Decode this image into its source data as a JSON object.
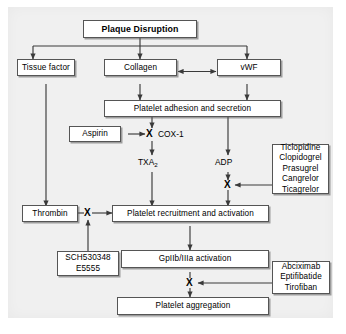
{
  "figure": {
    "background_color": "#f0f0f0",
    "line_color": "#3a3a3a",
    "box_border_color": "#555555",
    "box_fill_color": "#ffffff"
  },
  "nodes": {
    "plaque_disruption": "Plaque Disruption",
    "tissue_factor": "Tissue factor",
    "collagen": "Collagen",
    "vwf": "vWF",
    "platelet_adhesion": "Platelet adhesion and secretion",
    "aspirin": "Aspirin",
    "thrombin": "Thrombin",
    "platelet_recruitment": "Platelet recruitment and activation",
    "gpiibiiia": "GpIIb/IIIa activation",
    "platelet_aggregation": "Platelet aggregation"
  },
  "free_labels": {
    "cox1": "COX-1",
    "txa2_base": "TXA",
    "txa2_sub": "2",
    "adp": "ADP"
  },
  "drug_boxes": {
    "p2y12_inhibitors": {
      "name": "P2Y12 receptor inhibitors",
      "drugs": [
        "Ticlopidine",
        "Clopidogrel",
        "Prasugrel",
        "Cangrelor",
        "Ticagrelor"
      ]
    },
    "par1_antagonists": {
      "name": "Thrombin receptor antagonists",
      "drugs": [
        "SCH530348",
        "E5555"
      ]
    },
    "gpiibiiia_inhibitors": {
      "name": "GpIIb/IIIa inhibitors",
      "drugs": [
        "Abciximab",
        "Eptifibatide",
        "Tirofiban"
      ]
    }
  },
  "inhibition_markers": [
    {
      "id": "cox1-block",
      "target": "COX-1",
      "by": "Aspirin",
      "glyph": "X"
    },
    {
      "id": "adp-block",
      "target": "ADP receptor",
      "by": "P2Y12 inhibitors",
      "glyph": "X"
    },
    {
      "id": "thrombin-block",
      "target": "Thrombin signaling",
      "by": "SCH530348 / E5555",
      "glyph": "X"
    },
    {
      "id": "gpiibiiia-block",
      "target": "GpIIb/IIIa",
      "by": "Abciximab / Eptifibatide / Tirofiban",
      "glyph": "X"
    }
  ],
  "edges": [
    {
      "from": "Plaque Disruption",
      "to": "Tissue factor",
      "type": "arrow"
    },
    {
      "from": "Plaque Disruption",
      "to": "Collagen",
      "type": "arrow"
    },
    {
      "from": "Plaque Disruption",
      "to": "vWF",
      "type": "arrow"
    },
    {
      "from": "Collagen",
      "to": "vWF",
      "type": "double-arrow"
    },
    {
      "from": "Collagen",
      "to": "Platelet adhesion and secretion",
      "type": "arrow"
    },
    {
      "from": "vWF",
      "to": "Platelet adhesion and secretion",
      "type": "arrow"
    },
    {
      "from": "Tissue factor",
      "to": "Thrombin",
      "type": "arrow"
    },
    {
      "from": "Platelet adhesion and secretion",
      "to": "COX-1",
      "type": "arrow"
    },
    {
      "from": "Aspirin",
      "to": "COX-1",
      "type": "inhibit-arrow"
    },
    {
      "from": "COX-1",
      "to": "TXA2",
      "type": "arrow"
    },
    {
      "from": "TXA2",
      "to": "Platelet recruitment and activation",
      "type": "arrow"
    },
    {
      "from": "Platelet adhesion and secretion",
      "to": "ADP",
      "type": "arrow"
    },
    {
      "from": "ADP",
      "to": "Platelet recruitment and activation",
      "type": "arrow"
    },
    {
      "from": "P2Y12 inhibitors",
      "to": "ADP pathway",
      "type": "inhibit-arrow"
    },
    {
      "from": "Thrombin",
      "to": "Platelet recruitment and activation",
      "type": "arrow"
    },
    {
      "from": "SCH530348 / E5555",
      "to": "Thrombin pathway",
      "type": "inhibit-arrow"
    },
    {
      "from": "Platelet recruitment and activation",
      "to": "GpIIb/IIIa activation",
      "type": "arrow"
    },
    {
      "from": "GpIIb/IIIa activation",
      "to": "Platelet aggregation",
      "type": "arrow"
    },
    {
      "from": "GpIIb/IIIa inhibitors",
      "to": "GpIIb/IIIa pathway",
      "type": "inhibit-arrow"
    }
  ]
}
